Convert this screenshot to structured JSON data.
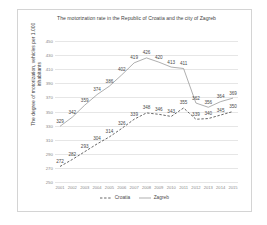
{
  "chart_data": {
    "type": "line",
    "title": "The motorization rate in the Republic of Croatia and the city of Zagreb",
    "xlabel": "",
    "ylabel": "The degree of motorization, vehicles per 1.000 inhabitants",
    "x": [
      "2001",
      "2002",
      "2003",
      "2004",
      "2005",
      "2006",
      "2007",
      "2008",
      "2009",
      "2010",
      "2011",
      "2012",
      "2013",
      "2014",
      "2015"
    ],
    "categories": [
      "2001",
      "2002",
      "2003",
      "2004",
      "2005",
      "2006",
      "2007",
      "2008",
      "2009",
      "2010",
      "2011",
      "2012",
      "2013",
      "2014",
      "2015"
    ],
    "yticks": [
      250,
      270,
      290,
      310,
      330,
      350,
      370,
      390,
      410,
      430,
      450
    ],
    "ylim": [
      250,
      450
    ],
    "grid": true,
    "legend_position": "bottom",
    "series": [
      {
        "name": "Croatia",
        "style": "dashed",
        "color": "#3f3f3f",
        "values": [
          272,
          282,
          293,
          304,
          314,
          326,
          339,
          348,
          346,
          343,
          355,
          339,
          340,
          345,
          350
        ]
      },
      {
        "name": "Zagreb",
        "style": "solid",
        "color": "#8c8c8c",
        "values": [
          329,
          342,
          359,
          374,
          386,
          402,
          419,
          426,
          420,
          413,
          411,
          362,
          356,
          364,
          369
        ]
      }
    ]
  }
}
